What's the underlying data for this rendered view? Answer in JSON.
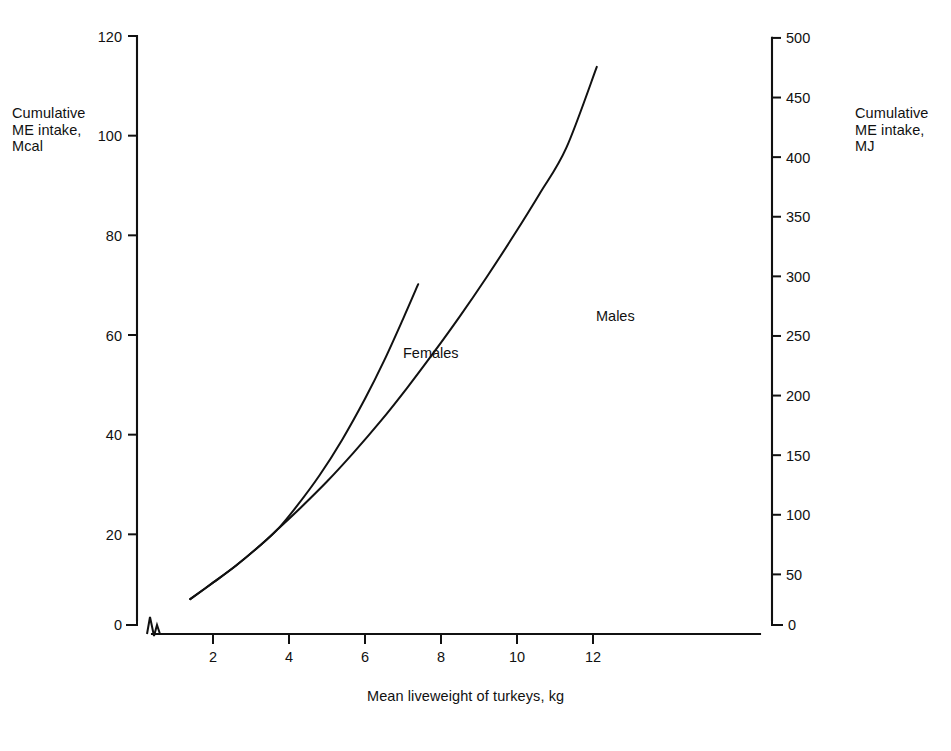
{
  "chart_data": {
    "type": "line",
    "title": "",
    "xlabel": "Mean liveweight of turkeys, kg",
    "ylabel": "Cumulative\nME intake,\nMcal",
    "ylabel_right": "Cumulative\nME intake,\nMJ",
    "xlim": [
      0,
      12.8
    ],
    "ylim": [
      0,
      122
    ],
    "ylim_right": [
      0,
      510
    ],
    "grid": false,
    "legend_position": "inline-annotation",
    "axis_break_x": true,
    "axis_break_y": true,
    "xticks": [
      2,
      4,
      6,
      8,
      10,
      12
    ],
    "xticklabels": [
      "2",
      "4",
      "6",
      "8",
      "10",
      "12"
    ],
    "yticks": [
      0,
      20,
      40,
      60,
      80,
      100,
      120
    ],
    "yticklabels": [
      "0",
      "20",
      "40",
      "60",
      "80",
      "100",
      "120"
    ],
    "yticks_right": [
      0,
      50,
      100,
      150,
      200,
      250,
      300,
      350,
      400,
      450,
      500
    ],
    "yticklabels_right": [
      "0",
      "50",
      "100",
      "150",
      "200",
      "250",
      "300",
      "350",
      "400",
      "450",
      "500"
    ],
    "unit_x": "kg",
    "unit_y_left": "Mcal",
    "unit_y_right": "MJ",
    "series": [
      {
        "name": "Males",
        "label": "Males",
        "x": [
          1.4,
          2.0,
          2.6,
          3.2,
          3.7,
          4.3,
          5.0,
          5.7,
          6.4,
          7.1,
          7.8,
          8.5,
          9.2,
          9.9,
          10.6,
          11.3,
          12.1
        ],
        "y": [
          7.0,
          10.3,
          13.7,
          17.5,
          21.0,
          25.3,
          30.6,
          36.4,
          42.6,
          49.3,
          56.4,
          63.8,
          71.6,
          79.8,
          88.4,
          97.6,
          113.8
        ]
      },
      {
        "name": "Females",
        "label": "Females",
        "x": [
          1.4,
          2.0,
          2.6,
          3.2,
          3.7,
          4.2,
          4.8,
          5.4,
          6.0,
          6.5,
          7.0,
          7.4
        ],
        "y": [
          7.0,
          10.3,
          13.7,
          17.5,
          21.0,
          25.6,
          31.8,
          39.0,
          47.2,
          54.8,
          63.2,
          70.2
        ]
      }
    ],
    "colors": {
      "axis": "#111111",
      "curve": "#111111",
      "background": "#ffffff"
    }
  }
}
